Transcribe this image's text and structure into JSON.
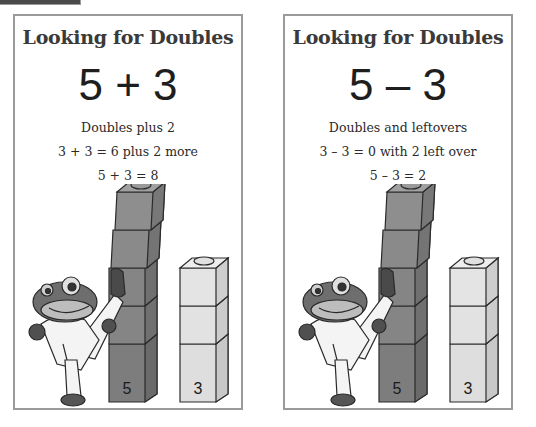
{
  "cards": [
    {
      "title": "Looking for Doubles",
      "expression": "5 + 3",
      "strategy": "Doubles plus 2",
      "step": "3 + 3 = 6 plus 2 more",
      "result": "5 + 3 = 8",
      "tall_tower": {
        "label": "5",
        "cubes": 5,
        "color": "#8a8a8a"
      },
      "short_tower": {
        "label": "3",
        "cubes": 3,
        "color": "#dcdcdc"
      }
    },
    {
      "title": "Looking for Doubles",
      "expression": "5 – 3",
      "strategy": "Doubles and leftovers",
      "step": "3 – 3 = 0 with 2 left over",
      "result": "5 – 3 = 2",
      "tall_tower": {
        "label": "5",
        "cubes": 5,
        "color": "#8a8a8a"
      },
      "short_tower": {
        "label": "3",
        "cubes": 3,
        "color": "#dcdcdc"
      }
    }
  ],
  "mascot": "karate-frog"
}
